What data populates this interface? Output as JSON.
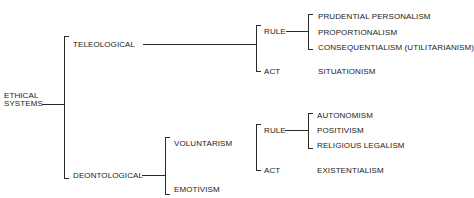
{
  "diagram": {
    "root": {
      "line1": "ETHICAL",
      "line2": "SYSTEMS"
    },
    "teleological": {
      "label": "TELEOLOGICAL",
      "rule": {
        "label": "RULE",
        "items": [
          "PRUDENTIAL PERSONALISM",
          "PROPORTIONALISM",
          "CONSEQUENTIALISM (UTILITARIANISM)"
        ]
      },
      "act": {
        "label": "ACT",
        "item": "SITUATIONISM"
      }
    },
    "deontological": {
      "label": "DEONTOLOGICAL",
      "voluntarism": "VOLUNTARISM",
      "emotivism": "EMOTIVISM",
      "rule": {
        "label": "RULE",
        "items": [
          "AUTONOMISM",
          "POSITIVISM",
          "RELIGIOUS LEGALISM"
        ]
      },
      "act": {
        "label": "ACT",
        "item": "EXISTENTIALISM"
      }
    }
  }
}
